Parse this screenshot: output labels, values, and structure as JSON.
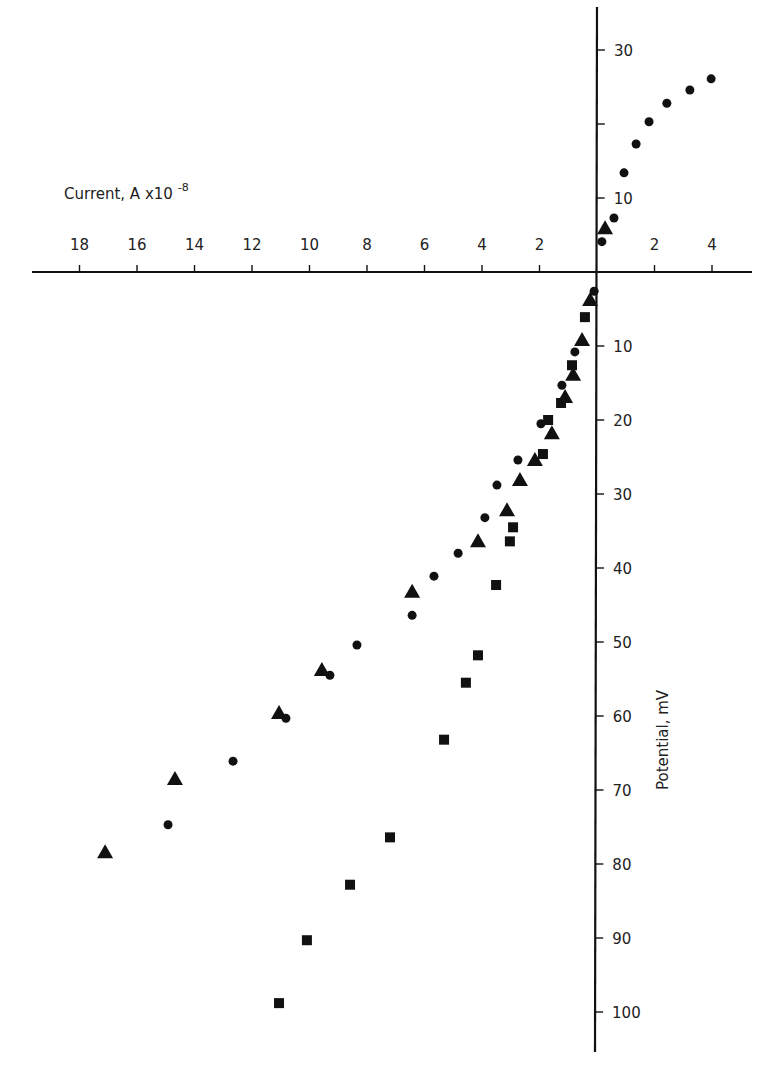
{
  "chart_data": {
    "type": "scatter",
    "title": "",
    "xlabel": "Current, A x10",
    "xlabel_exponent": "-8",
    "ylabel": "Potential, mV",
    "x_axis": {
      "range": [
        -18,
        4
      ],
      "ticks": [
        {
          "value": -18,
          "label": "18"
        },
        {
          "value": -16,
          "label": "16"
        },
        {
          "value": -14,
          "label": "14"
        },
        {
          "value": -12,
          "label": "12"
        },
        {
          "value": -10,
          "label": "10"
        },
        {
          "value": -8,
          "label": "8"
        },
        {
          "value": -6,
          "label": "6"
        },
        {
          "value": -4,
          "label": "4"
        },
        {
          "value": -2,
          "label": "2"
        },
        {
          "value": 2,
          "label": "2"
        },
        {
          "value": 4,
          "label": "4"
        }
      ]
    },
    "y_axis": {
      "range": [
        -105,
        35
      ],
      "ticks": [
        {
          "value": 30,
          "label": "30"
        },
        {
          "value": 20,
          "label": ""
        },
        {
          "value": 10,
          "label": "10"
        },
        {
          "value": -10,
          "label": "10"
        },
        {
          "value": -20,
          "label": "20"
        },
        {
          "value": -30,
          "label": "30"
        },
        {
          "value": -40,
          "label": "40"
        },
        {
          "value": -50,
          "label": "50"
        },
        {
          "value": -60,
          "label": "60"
        },
        {
          "value": -70,
          "label": "70"
        },
        {
          "value": -80,
          "label": "80"
        },
        {
          "value": -90,
          "label": "90"
        },
        {
          "value": -100,
          "label": "100"
        }
      ]
    },
    "grid": false,
    "legend": null,
    "series": [
      {
        "name": "circles",
        "marker": "circle",
        "points": [
          [
            3.97,
            26.1
          ],
          [
            3.23,
            24.6
          ],
          [
            2.43,
            22.8
          ],
          [
            1.81,
            20.3
          ],
          [
            1.36,
            17.3
          ],
          [
            0.94,
            13.4
          ],
          [
            0.59,
            7.3
          ],
          [
            0.17,
            4.1
          ],
          [
            -0.1,
            -2.6
          ],
          [
            -0.77,
            -10.8
          ],
          [
            -1.22,
            -15.3
          ],
          [
            -1.95,
            -20.5
          ],
          [
            -2.75,
            -25.4
          ],
          [
            -3.48,
            -28.8
          ],
          [
            -3.9,
            -33.2
          ],
          [
            -4.83,
            -38.0
          ],
          [
            -5.67,
            -41.1
          ],
          [
            -6.43,
            -46.4
          ],
          [
            -8.35,
            -50.4
          ],
          [
            -9.29,
            -54.5
          ],
          [
            -10.82,
            -60.3
          ],
          [
            -12.66,
            -66.1
          ],
          [
            -14.92,
            -74.7
          ]
        ]
      },
      {
        "name": "triangles",
        "marker": "triangle",
        "points": [
          [
            0.28,
            5.9
          ],
          [
            -0.24,
            -3.8
          ],
          [
            -0.52,
            -9.2
          ],
          [
            -0.83,
            -13.9
          ],
          [
            -1.11,
            -16.9
          ],
          [
            -1.57,
            -21.8
          ],
          [
            -2.16,
            -25.4
          ],
          [
            -2.68,
            -28.1
          ],
          [
            -3.13,
            -32.2
          ],
          [
            -4.14,
            -36.4
          ],
          [
            -6.43,
            -43.2
          ],
          [
            -9.57,
            -53.8
          ],
          [
            -11.06,
            -59.6
          ],
          [
            -14.68,
            -68.5
          ],
          [
            -17.11,
            -78.4
          ]
        ]
      },
      {
        "name": "squares",
        "marker": "square",
        "points": [
          [
            -0.42,
            -6.1
          ],
          [
            -0.87,
            -12.6
          ],
          [
            -1.25,
            -17.7
          ],
          [
            -1.7,
            -20.0
          ],
          [
            -1.88,
            -24.6
          ],
          [
            -2.92,
            -34.5
          ],
          [
            -3.03,
            -36.4
          ],
          [
            -3.51,
            -42.3
          ],
          [
            -4.14,
            -51.8
          ],
          [
            -4.56,
            -55.5
          ],
          [
            -5.32,
            -63.2
          ],
          [
            -7.2,
            -76.4
          ],
          [
            -8.59,
            -82.8
          ],
          [
            -10.09,
            -90.3
          ],
          [
            -11.06,
            -98.8
          ]
        ]
      }
    ]
  }
}
